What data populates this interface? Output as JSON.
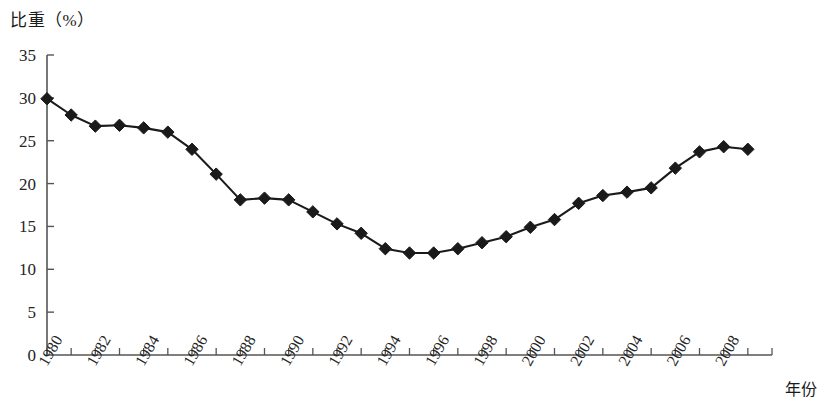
{
  "chart_data": {
    "type": "line",
    "title": "比重（%）",
    "xlabel": "年份",
    "ylabel": "比重（%）",
    "xlim": [
      1980,
      2010
    ],
    "ylim": [
      0,
      35
    ],
    "ytick_step": 5,
    "xtick_step": 1,
    "xtick_label_step": 2,
    "grid": false,
    "legend": false,
    "marker": "diamond",
    "series_color": "#1a1a1a",
    "yticks": [
      "0",
      "5",
      "10",
      "15",
      "20",
      "25",
      "30",
      "35"
    ],
    "xticks": [
      "1980",
      "1982",
      "1984",
      "1986",
      "1988",
      "1990",
      "1992",
      "1994",
      "1996",
      "1998",
      "2000",
      "2002",
      "2004",
      "2006",
      "2008"
    ],
    "x": [
      1980,
      1981,
      1982,
      1983,
      1984,
      1985,
      1986,
      1987,
      1988,
      1989,
      1990,
      1991,
      1992,
      1993,
      1994,
      1995,
      1996,
      1997,
      1998,
      1999,
      2000,
      2001,
      2002,
      2003,
      2004,
      2005,
      2006,
      2007,
      2008,
      2009
    ],
    "values": [
      29.9,
      28.0,
      26.7,
      26.8,
      26.5,
      26.0,
      24.0,
      21.1,
      18.1,
      18.3,
      18.1,
      16.7,
      15.3,
      14.2,
      12.4,
      11.9,
      11.9,
      12.4,
      13.1,
      13.8,
      14.9,
      15.8,
      17.7,
      18.6,
      19.0,
      19.5,
      21.8,
      23.7,
      24.3,
      24.0
    ]
  }
}
